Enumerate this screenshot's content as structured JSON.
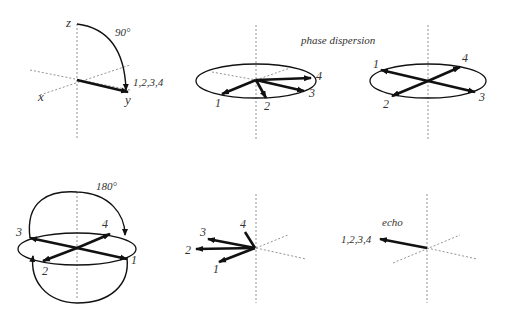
{
  "figure": {
    "panels": [
      {
        "id": "p1",
        "step": "90° pulse",
        "axis_labels": {
          "z": "z",
          "x": "x",
          "y": "y"
        },
        "pulse_label": "90°",
        "vector_label": "1,2,3,4"
      },
      {
        "id": "p2",
        "step": "dephasing",
        "vector_labels": [
          "1",
          "2",
          "3",
          "4"
        ]
      },
      {
        "id": "p3",
        "step": "full dispersion",
        "vector_labels": [
          "1",
          "2",
          "3",
          "4"
        ]
      },
      {
        "id": "p4",
        "step": "180° pulse",
        "pulse_label": "180°",
        "vector_labels": [
          "3",
          "4",
          "2",
          "1"
        ]
      },
      {
        "id": "p5",
        "step": "rephasing",
        "vector_labels": [
          "4",
          "3",
          "2",
          "1"
        ]
      },
      {
        "id": "p6",
        "step": "echo",
        "echo_label": "echo",
        "vector_label": "1,2,3,4"
      }
    ],
    "annotation": "phase dispersion",
    "colors": {
      "ink": "#111111",
      "axis": "#777777",
      "text": "#333333"
    }
  }
}
